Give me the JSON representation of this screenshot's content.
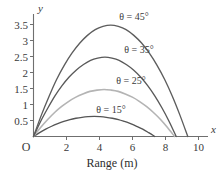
{
  "chart_data": {
    "type": "line",
    "title": "",
    "xlabel": "Range (m)",
    "ylabel": "y",
    "x_axis_name": "x",
    "y_axis_name": "y",
    "origin_label": "O",
    "xlim": [
      0,
      10.6
    ],
    "ylim": [
      0,
      3.75
    ],
    "xticks": [
      2,
      4,
      6,
      8,
      10
    ],
    "xtick_labels": [
      "2",
      "4",
      "6",
      "8",
      "10"
    ],
    "yticks": [
      0.5,
      1,
      1.5,
      2,
      2.5,
      3,
      3.5
    ],
    "ytick_labels": [
      "0.5",
      "1",
      "1.5",
      "2",
      "2.5",
      "3",
      "3.5"
    ],
    "grid": false,
    "legend_position": "inline-annotations",
    "series": [
      {
        "name": "theta = 45",
        "label": "θ = 45°",
        "color": "#5d5d5d",
        "angle_deg": 45,
        "range_m": 9.35,
        "peak_x": 4.68,
        "peak_y": 3.48,
        "x": [
          0,
          0.47,
          0.94,
          1.4,
          1.87,
          2.34,
          2.81,
          3.27,
          3.74,
          4.21,
          4.68,
          5.14,
          5.61,
          6.08,
          6.55,
          7.01,
          7.48,
          7.95,
          8.42,
          8.88,
          9.35
        ],
        "y": [
          0,
          0.66,
          1.25,
          1.78,
          2.23,
          2.61,
          2.92,
          3.16,
          3.34,
          3.44,
          3.48,
          3.44,
          3.34,
          3.16,
          2.92,
          2.61,
          2.23,
          1.78,
          1.25,
          0.66,
          0
        ]
      },
      {
        "name": "theta = 35",
        "label": "θ = 35°",
        "color": "#595959",
        "angle_deg": 35,
        "range_m": 8.65,
        "peak_x": 4.33,
        "peak_y": 2.48,
        "x": [
          0,
          0.43,
          0.87,
          1.3,
          1.73,
          2.16,
          2.6,
          3.03,
          3.46,
          3.89,
          4.33,
          4.76,
          5.19,
          5.62,
          6.06,
          6.49,
          6.92,
          7.35,
          7.79,
          8.22,
          8.65
        ],
        "y": [
          0,
          0.47,
          0.89,
          1.27,
          1.59,
          1.86,
          2.08,
          2.25,
          2.38,
          2.45,
          2.48,
          2.45,
          2.38,
          2.25,
          2.08,
          1.86,
          1.59,
          1.27,
          0.89,
          0.47,
          0
        ]
      },
      {
        "name": "theta = 25",
        "label": "θ = 25°",
        "color": "#b4b4b4",
        "angle_deg": 25,
        "range_m": 8.55,
        "peak_x": 4.28,
        "peak_y": 1.47,
        "x": [
          0,
          0.43,
          0.86,
          1.28,
          1.71,
          2.14,
          2.57,
          2.99,
          3.42,
          3.85,
          4.28,
          4.7,
          5.13,
          5.56,
          5.99,
          6.41,
          6.84,
          7.27,
          7.7,
          8.12,
          8.55
        ],
        "y": [
          0,
          0.28,
          0.53,
          0.75,
          0.94,
          1.1,
          1.23,
          1.33,
          1.41,
          1.45,
          1.47,
          1.45,
          1.41,
          1.33,
          1.23,
          1.1,
          0.94,
          0.75,
          0.53,
          0.28,
          0
        ]
      },
      {
        "name": "theta = 15",
        "label": "θ = 15°",
        "color": "#555555",
        "angle_deg": 15,
        "range_m": 7.35,
        "peak_x": 3.68,
        "peak_y": 0.63,
        "x": [
          0,
          0.37,
          0.74,
          1.1,
          1.47,
          1.84,
          2.21,
          2.57,
          2.94,
          3.31,
          3.68,
          4.04,
          4.41,
          4.78,
          5.15,
          5.51,
          5.88,
          6.25,
          6.62,
          6.98,
          7.35
        ],
        "y": [
          0,
          0.12,
          0.23,
          0.32,
          0.4,
          0.47,
          0.53,
          0.57,
          0.6,
          0.62,
          0.63,
          0.62,
          0.6,
          0.57,
          0.53,
          0.47,
          0.4,
          0.32,
          0.23,
          0.12,
          0
        ]
      }
    ],
    "annotations": [
      {
        "text": "θ = 45°",
        "x_px": 134,
        "y_px": 20
      },
      {
        "text": "θ = 35°",
        "x_px": 139,
        "y_px": 53
      },
      {
        "text": "θ = 25°",
        "x_px": 131,
        "y_px": 84
      },
      {
        "text": "θ = 15°",
        "x_px": 111,
        "y_px": 113
      }
    ]
  },
  "colors": {
    "axis": "#6f6f6f",
    "text": "#3a3a3a",
    "background": "#ffffff"
  }
}
